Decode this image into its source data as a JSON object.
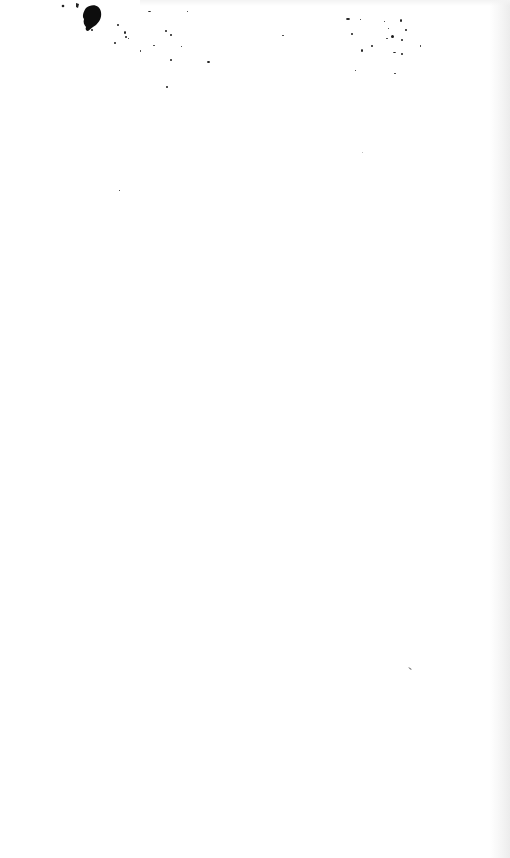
{
  "page": {
    "type": "blank-scanned-page",
    "background": "#ffffff",
    "ink_color": "#111111",
    "text": ""
  }
}
